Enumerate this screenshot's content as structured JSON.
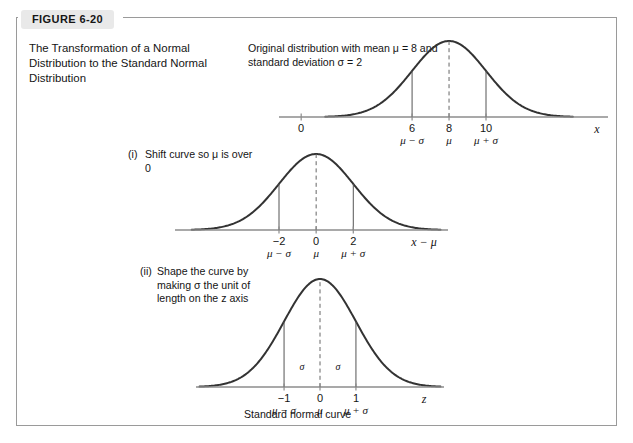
{
  "figure": {
    "tab_label": "FIGURE 6-20",
    "title": "The Transformation of a Normal Distribution to the Standard Normal Distribution",
    "original_caption": "Original distribution with mean μ = 8 and standard deviation σ = 2",
    "standard_curve_caption": "Standard normal curve",
    "frame_color": "#9a9a9a",
    "tab_background": "#e9e9e9",
    "curve_color": "#333333",
    "axis_color": "#8c8c8c"
  },
  "steps": [
    {
      "number": "(i)",
      "text": "Shift curve so μ is over 0"
    },
    {
      "number": "(ii)",
      "text": "Shape the curve by making σ the unit of length on the z axis"
    }
  ],
  "chart_data": [
    {
      "type": "line",
      "name": "original-normal-distribution",
      "title": "Original distribution with mean μ = 8 and standard deviation σ = 2",
      "distribution": "normal",
      "mean": 8,
      "sigma": 2,
      "xlabel": "x",
      "grid": false,
      "axis_ticks": [
        {
          "value": 0,
          "label": "0",
          "sublabel": ""
        },
        {
          "value": 6,
          "label": "6",
          "sublabel": "μ − σ"
        },
        {
          "value": 8,
          "label": "8",
          "sublabel": "μ"
        },
        {
          "value": 10,
          "label": "10",
          "sublabel": "μ + σ"
        }
      ],
      "droplines": [
        {
          "value": 6,
          "style": "solid"
        },
        {
          "value": 8,
          "style": "dashed"
        },
        {
          "value": 10,
          "style": "solid"
        }
      ]
    },
    {
      "type": "line",
      "name": "shifted-normal-distribution",
      "title": "Shift curve so μ is over 0",
      "distribution": "normal",
      "mean": 0,
      "sigma": 2,
      "xlabel": "x − μ",
      "grid": false,
      "axis_ticks": [
        {
          "value": -2,
          "label": "−2",
          "sublabel": "μ − σ"
        },
        {
          "value": 0,
          "label": "0",
          "sublabel": "μ"
        },
        {
          "value": 2,
          "label": "2",
          "sublabel": "μ + σ"
        }
      ],
      "droplines": [
        {
          "value": -2,
          "style": "solid"
        },
        {
          "value": 0,
          "style": "dashed"
        },
        {
          "value": 2,
          "style": "solid"
        }
      ]
    },
    {
      "type": "line",
      "name": "standard-normal-distribution",
      "title": "Standard normal curve",
      "distribution": "normal",
      "mean": 0,
      "sigma": 1,
      "xlabel": "z",
      "grid": false,
      "axis_ticks": [
        {
          "value": -1,
          "label": "−1",
          "sublabel": "μ − σ"
        },
        {
          "value": 0,
          "label": "0",
          "sublabel": "μ"
        },
        {
          "value": 1,
          "label": "1",
          "sublabel": "μ + σ"
        }
      ],
      "droplines": [
        {
          "value": -1,
          "style": "solid"
        },
        {
          "value": 0,
          "style": "dashed"
        },
        {
          "value": 1,
          "style": "solid"
        }
      ],
      "inner_labels": [
        {
          "text": "σ",
          "between": [
            -1,
            0
          ]
        },
        {
          "text": "σ",
          "between": [
            0,
            1
          ]
        }
      ]
    }
  ]
}
